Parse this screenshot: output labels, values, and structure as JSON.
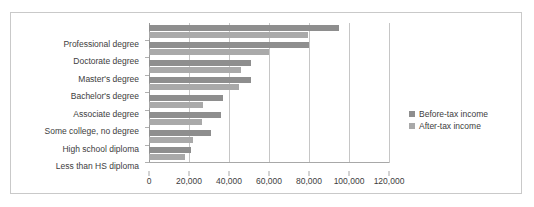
{
  "chart_data": {
    "type": "bar",
    "orientation": "horizontal",
    "title": "",
    "xlabel": "",
    "ylabel": "",
    "xlim": [
      0,
      120000
    ],
    "xticks": [
      "0",
      "20,000",
      "40,000",
      "60,000",
      "80,000",
      "100,000",
      "120,000"
    ],
    "xtick_values": [
      0,
      20000,
      40000,
      60000,
      80000,
      100000,
      120000
    ],
    "grid": true,
    "legend_position": "right",
    "categories": [
      "Professional degree",
      "Doctorate degree",
      "Master's degree",
      "Bachelor's degree",
      "Associate degree",
      "Some college, no degree",
      "High school diploma",
      "Less than HS diploma"
    ],
    "series": [
      {
        "name": "Before-tax income",
        "color": "#8e8e8e",
        "values": [
          95000,
          80000,
          51000,
          51000,
          37000,
          36000,
          31000,
          21000
        ]
      },
      {
        "name": "After-tax income",
        "color": "#a9a9a9",
        "values": [
          79500,
          60000,
          46000,
          45000,
          27000,
          26500,
          22000,
          18000
        ]
      }
    ]
  },
  "legend": {
    "items": [
      {
        "label": "Before-tax income",
        "color": "#8e8e8e"
      },
      {
        "label": "After-tax income",
        "color": "#a9a9a9"
      }
    ]
  },
  "colors": {
    "before_tax": "#8e8e8e",
    "after_tax": "#a9a9a9",
    "gridline": "#c6c6c6",
    "axis": "#a8a8a8",
    "frame": "#c9c9c9",
    "text": "#3d3d3d"
  }
}
